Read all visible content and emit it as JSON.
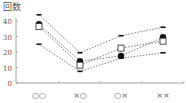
{
  "chart_data": {
    "type": "line",
    "title": "",
    "ylabel": "回数",
    "xlabel": "",
    "ylim": [
      0,
      45
    ],
    "yticks": [
      0,
      10,
      20,
      30,
      40
    ],
    "grid": false,
    "legend": null,
    "categories": [
      "○○",
      "×○",
      "○×",
      "××"
    ],
    "series": [
      {
        "name": "upper",
        "marker": "dash",
        "line": "dotted",
        "values": [
          44,
          19.5,
          30.5,
          36
        ]
      },
      {
        "name": "filled-circle",
        "marker": "circle-filled",
        "line": "dotted",
        "values": [
          38,
          14,
          17.5,
          29.5
        ]
      },
      {
        "name": "open-square",
        "marker": "square-open",
        "line": "dotted",
        "values": [
          36.5,
          11.5,
          22.5,
          27
        ]
      },
      {
        "name": "lower",
        "marker": "dash",
        "line": "dotted",
        "values": [
          25,
          7.5,
          16,
          19.5
        ]
      }
    ]
  },
  "axis": {
    "y_title": "回数",
    "y_ticks": [
      "0",
      "10",
      "20",
      "30",
      "40"
    ],
    "x_labels": [
      "○○",
      "×○",
      "○×",
      "××"
    ]
  }
}
